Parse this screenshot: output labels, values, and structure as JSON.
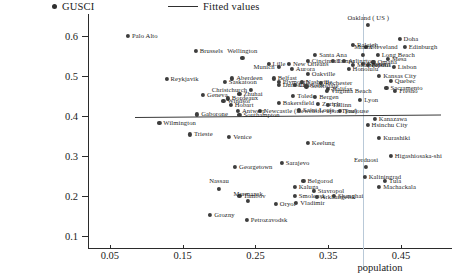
{
  "chart_data": {
    "type": "scatter",
    "title": "",
    "xlabel": "population",
    "ylabel": "",
    "xlim": [
      0.02,
      0.52
    ],
    "ylim": [
      0.07,
      0.655
    ],
    "xticks": [
      "0.05",
      "0.15",
      "0.25",
      "0.35",
      "0.45"
    ],
    "xtick_values": [
      0.05,
      0.15,
      0.25,
      0.35,
      0.45
    ],
    "yticks": [
      "0.1",
      "0.2",
      "0.3",
      "0.4",
      "0.5",
      "0.6"
    ],
    "ytick_values": [
      0.1,
      0.2,
      0.3,
      0.4,
      0.5,
      0.6
    ],
    "grid": false,
    "legend": [
      {
        "label": "GUSCI",
        "marker": "dot"
      },
      {
        "label": "Fitted values",
        "marker": "line"
      }
    ],
    "fit_line": {
      "x0": 0.085,
      "y0": 0.398,
      "x1": 0.505,
      "y1": 0.404
    },
    "reference_line": {
      "x": 0.398,
      "orientation": "vertical",
      "color": "#b9c9d8"
    },
    "points": [
      {
        "label": "Palo Alto",
        "x": 0.075,
        "y": 0.6,
        "pos": "r"
      },
      {
        "label": "Brussels",
        "x": 0.168,
        "y": 0.562,
        "pos": "r"
      },
      {
        "label": "Wellington",
        "x": 0.232,
        "y": 0.545,
        "pos": "t"
      },
      {
        "label": "Lille",
        "x": 0.268,
        "y": 0.53,
        "pos": "r"
      },
      {
        "label": "Reykjavik",
        "x": 0.128,
        "y": 0.493,
        "pos": "r"
      },
      {
        "label": "Santa Ana",
        "x": 0.332,
        "y": 0.553,
        "pos": "r"
      },
      {
        "label": "Oakland ( US )",
        "x": 0.405,
        "y": 0.627,
        "pos": "t"
      },
      {
        "label": "Doha",
        "x": 0.448,
        "y": 0.592,
        "pos": "r"
      },
      {
        "label": "Raleigh",
        "x": 0.384,
        "y": 0.578,
        "pos": "r"
      },
      {
        "label": "Cleveland",
        "x": 0.402,
        "y": 0.572,
        "pos": "r"
      },
      {
        "label": "Edinburgh",
        "x": 0.455,
        "y": 0.572,
        "pos": "r"
      },
      {
        "label": "Miami",
        "x": 0.398,
        "y": 0.553,
        "pos": "t"
      },
      {
        "label": "Long Beach",
        "x": 0.418,
        "y": 0.553,
        "pos": "r"
      },
      {
        "label": "Mesa",
        "x": 0.432,
        "y": 0.543,
        "pos": "r"
      },
      {
        "label": "Cincinnati",
        "x": 0.322,
        "y": 0.538,
        "pos": "r"
      },
      {
        "label": "Tampa",
        "x": 0.356,
        "y": 0.538,
        "pos": "r"
      },
      {
        "label": "Arlington",
        "x": 0.372,
        "y": 0.537,
        "pos": "r"
      },
      {
        "label": "Omaha",
        "x": 0.412,
        "y": 0.535,
        "pos": "r"
      },
      {
        "label": "New Orleans",
        "x": 0.296,
        "y": 0.53,
        "pos": "r"
      },
      {
        "label": "Minneapolis",
        "x": 0.384,
        "y": 0.528,
        "pos": "r"
      },
      {
        "label": "Bristol",
        "x": 0.404,
        "y": 0.527,
        "pos": "r"
      },
      {
        "label": "Lisbon",
        "x": 0.44,
        "y": 0.523,
        "pos": "r"
      },
      {
        "label": "Honolulu",
        "x": 0.378,
        "y": 0.518,
        "pos": "r"
      },
      {
        "label": "Aurora",
        "x": 0.3,
        "y": 0.517,
        "pos": "r"
      },
      {
        "label": "Munich",
        "x": 0.282,
        "y": 0.522,
        "pos": "l"
      },
      {
        "label": "Nantes",
        "x": 0.398,
        "y": 0.53,
        "pos": "r"
      },
      {
        "label": "Aberdeen",
        "x": 0.218,
        "y": 0.494,
        "pos": "r"
      },
      {
        "label": "Saskatoon",
        "x": 0.208,
        "y": 0.486,
        "pos": "r"
      },
      {
        "label": "Belfast",
        "x": 0.275,
        "y": 0.494,
        "pos": "r"
      },
      {
        "label": "Plymouth",
        "x": 0.282,
        "y": 0.486,
        "pos": "r"
      },
      {
        "label": "Oakville",
        "x": 0.322,
        "y": 0.505,
        "pos": "r"
      },
      {
        "label": "Kansas City",
        "x": 0.42,
        "y": 0.5,
        "pos": "r"
      },
      {
        "label": "Quebec",
        "x": 0.436,
        "y": 0.487,
        "pos": "r"
      },
      {
        "label": "Nashville",
        "x": 0.314,
        "y": 0.485,
        "pos": "r"
      },
      {
        "label": "Rochester",
        "x": 0.34,
        "y": 0.482,
        "pos": "r"
      },
      {
        "label": "Dunedin",
        "x": 0.282,
        "y": 0.477,
        "pos": "r"
      },
      {
        "label": "Charlotte",
        "x": 0.304,
        "y": 0.478,
        "pos": "r"
      },
      {
        "label": "Scottsdale",
        "x": 0.32,
        "y": 0.474,
        "pos": "r"
      },
      {
        "label": "Geneva",
        "x": 0.178,
        "y": 0.452,
        "pos": "r"
      },
      {
        "label": "Bordeaux",
        "x": 0.212,
        "y": 0.444,
        "pos": "r"
      },
      {
        "label": "Windsor",
        "x": 0.206,
        "y": 0.438,
        "pos": "r"
      },
      {
        "label": "Hobart",
        "x": 0.216,
        "y": 0.428,
        "pos": "r"
      },
      {
        "label": "Toledo",
        "x": 0.302,
        "y": 0.45,
        "pos": "r"
      },
      {
        "label": "Bergen",
        "x": 0.332,
        "y": 0.448,
        "pos": "r"
      },
      {
        "label": "Halifax",
        "x": 0.35,
        "y": 0.467,
        "pos": "r"
      },
      {
        "label": "Christchurch",
        "x": 0.244,
        "y": 0.465,
        "pos": "l"
      },
      {
        "label": "Virginia Beach",
        "x": 0.348,
        "y": 0.462,
        "pos": "r"
      },
      {
        "label": "Sacramento",
        "x": 0.43,
        "y": 0.47,
        "pos": "r"
      },
      {
        "label": "Fresno",
        "x": 0.442,
        "y": 0.462,
        "pos": "r"
      },
      {
        "label": "Zhuhai",
        "x": 0.228,
        "y": 0.456,
        "pos": "r"
      },
      {
        "label": "Bakersfield",
        "x": 0.282,
        "y": 0.432,
        "pos": "r"
      },
      {
        "label": "Zurich",
        "x": 0.336,
        "y": 0.43,
        "pos": "r"
      },
      {
        "label": "Tallinn",
        "x": 0.35,
        "y": 0.427,
        "pos": "r"
      },
      {
        "label": "Lyon",
        "x": 0.394,
        "y": 0.44,
        "pos": "r"
      },
      {
        "label": "Newcastle (Newcastle upon Tyne)",
        "x": 0.256,
        "y": 0.412,
        "pos": "r"
      },
      {
        "label": "Saint Louis",
        "x": 0.31,
        "y": 0.414,
        "pos": "r"
      },
      {
        "label": "Toulouse",
        "x": 0.366,
        "y": 0.412,
        "pos": "r"
      },
      {
        "label": "Antwerp",
        "x": 0.226,
        "y": 0.412,
        "pos": "r"
      },
      {
        "label": "Southampton",
        "x": 0.228,
        "y": 0.403,
        "pos": "r"
      },
      {
        "label": "Gaborone",
        "x": 0.17,
        "y": 0.404,
        "pos": "r"
      },
      {
        "label": "Wilmington",
        "x": 0.118,
        "y": 0.382,
        "pos": "r"
      },
      {
        "label": "Kanazawa",
        "x": 0.414,
        "y": 0.392,
        "pos": "r"
      },
      {
        "label": "Hsinchu City",
        "x": 0.404,
        "y": 0.378,
        "pos": "r"
      },
      {
        "label": "Trieste",
        "x": 0.16,
        "y": 0.354,
        "pos": "r"
      },
      {
        "label": "Venice",
        "x": 0.214,
        "y": 0.348,
        "pos": "r"
      },
      {
        "label": "Keelung",
        "x": 0.322,
        "y": 0.332,
        "pos": "r"
      },
      {
        "label": "Kurashiki",
        "x": 0.42,
        "y": 0.345,
        "pos": "r"
      },
      {
        "label": "Higashiosaka-shi",
        "x": 0.436,
        "y": 0.3,
        "pos": "r"
      },
      {
        "label": "Georgetown",
        "x": 0.222,
        "y": 0.273,
        "pos": "r"
      },
      {
        "label": "Sarajevo",
        "x": 0.286,
        "y": 0.282,
        "pos": "r"
      },
      {
        "label": "Eerduosi",
        "x": 0.402,
        "y": 0.272,
        "pos": "t"
      },
      {
        "label": "Kaliningrad",
        "x": 0.4,
        "y": 0.248,
        "pos": "r"
      },
      {
        "label": "Belgorod",
        "x": 0.316,
        "y": 0.237,
        "pos": "r"
      },
      {
        "label": "Tula",
        "x": 0.428,
        "y": 0.237,
        "pos": "r"
      },
      {
        "label": "Machackala",
        "x": 0.42,
        "y": 0.222,
        "pos": "r"
      },
      {
        "label": "Nassau",
        "x": 0.2,
        "y": 0.218,
        "pos": "t"
      },
      {
        "label": "Kaluga",
        "x": 0.304,
        "y": 0.222,
        "pos": "r"
      },
      {
        "label": "Tambov",
        "x": 0.228,
        "y": 0.2,
        "pos": "r"
      },
      {
        "label": "Stavropol",
        "x": 0.33,
        "y": 0.212,
        "pos": "r"
      },
      {
        "label": "Smolensk",
        "x": 0.304,
        "y": 0.2,
        "pos": "r"
      },
      {
        "label": "Arkhangelsk",
        "x": 0.334,
        "y": 0.198,
        "pos": "r"
      },
      {
        "label": "Shanghai",
        "x": 0.358,
        "y": 0.2,
        "pos": "r"
      },
      {
        "label": "Murmansk",
        "x": 0.24,
        "y": 0.187,
        "pos": "t"
      },
      {
        "label": "Oryol",
        "x": 0.278,
        "y": 0.18,
        "pos": "r"
      },
      {
        "label": "Vladimir",
        "x": 0.306,
        "y": 0.182,
        "pos": "r"
      },
      {
        "label": "Grozny",
        "x": 0.188,
        "y": 0.152,
        "pos": "r"
      },
      {
        "label": "Petrozavodsk",
        "x": 0.238,
        "y": 0.14,
        "pos": "r"
      }
    ]
  }
}
